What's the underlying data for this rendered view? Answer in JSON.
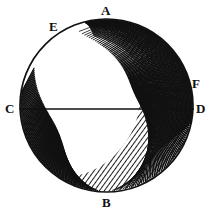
{
  "figure": {
    "style": "engraving",
    "background_color": "#ffffff",
    "ink_color": "#111111",
    "width": 214,
    "height": 215
  },
  "circle": {
    "center_x": 106.5,
    "center_y": 105.5,
    "radius": 87,
    "stroke_color": "#111111",
    "stroke_width": 1.6
  },
  "diameter": {
    "name": "CD",
    "from": "C",
    "to": "D",
    "x1": 19.5,
    "y1": 109,
    "x2": 194,
    "y2": 109,
    "stroke_color": "#111111",
    "stroke_width": 1.5
  },
  "labels": {
    "A": "A",
    "B": "B",
    "C": "C",
    "D": "D",
    "E": "E",
    "F": "F"
  },
  "points": [
    {
      "id": "A",
      "label": "A",
      "x": 107,
      "y": 18,
      "position": "top"
    },
    {
      "id": "B",
      "label": "B",
      "x": 107,
      "y": 193,
      "position": "bottom"
    },
    {
      "id": "C",
      "label": "C",
      "x": 19.5,
      "y": 109,
      "position": "left"
    },
    {
      "id": "D",
      "label": "D",
      "x": 194,
      "y": 109,
      "position": "right"
    },
    {
      "id": "E",
      "label": "E",
      "x": 58,
      "y": 33,
      "position": "upper-left"
    },
    {
      "id": "F",
      "label": "F",
      "x": 188,
      "y": 83,
      "position": "right-upper"
    }
  ],
  "shading": {
    "description": "crescent / gibbous hatched region along right and lower-left limb",
    "hatch_color": "#111111",
    "regions": [
      {
        "id": "right-crescent",
        "style": "dense-diagonal-hatch"
      },
      {
        "id": "lower-left-limb",
        "style": "radial-comb-hatch"
      },
      {
        "id": "upper-arc",
        "style": "thin-curved-hatch"
      }
    ]
  },
  "chart_data": {
    "type": "scatter",
    "xlabel": "",
    "ylabel": "",
    "categories": [
      "A",
      "B",
      "C",
      "D",
      "E",
      "F"
    ],
    "values": [
      18,
      193,
      109,
      109,
      33,
      83
    ],
    "annotations": [
      "A",
      "B",
      "C",
      "D",
      "E",
      "F"
    ],
    "legend": []
  }
}
